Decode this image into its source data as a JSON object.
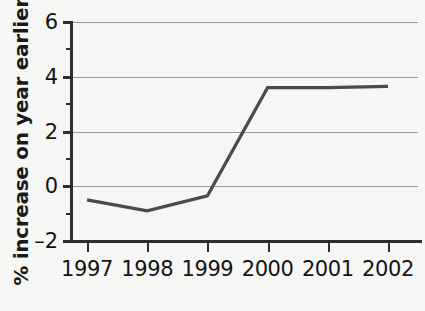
{
  "chart_data": {
    "type": "line",
    "title": "",
    "xlabel": "",
    "ylabel": "% increase on year earlier",
    "categories": [
      "1997",
      "1998",
      "1999",
      "2000",
      "2001",
      "2002"
    ],
    "values": [
      -0.5,
      -0.9,
      -0.35,
      3.6,
      3.6,
      3.65
    ],
    "series": [
      {
        "name": "% increase on year earlier",
        "values": [
          -0.5,
          -0.9,
          -0.35,
          3.6,
          3.6,
          3.65
        ]
      }
    ],
    "ylim": [
      -2,
      6
    ],
    "ytick_labels": [
      "6",
      "4",
      "2",
      "0",
      "-2"
    ],
    "ytick_values": [
      6,
      4,
      2,
      0,
      -2
    ],
    "yminor_tick_values": [
      5,
      3,
      1,
      -1
    ],
    "xtick_labels": [
      "1997",
      "1998",
      "1999",
      "2000",
      "2001",
      "2002"
    ],
    "grid": true,
    "legend": "none",
    "line_color": "#4a4a4a",
    "grid_color": "#9a9a9a",
    "axis_color": "#2e2e2e",
    "background_color": "#f6f6f4"
  },
  "axis": {
    "y_title": "% increase on year earlier",
    "y_labels": [
      "6",
      "4",
      "2",
      "0",
      "–2"
    ],
    "x_labels": [
      "1997",
      "1998",
      "1999",
      "2000",
      "2001",
      "2002"
    ]
  }
}
